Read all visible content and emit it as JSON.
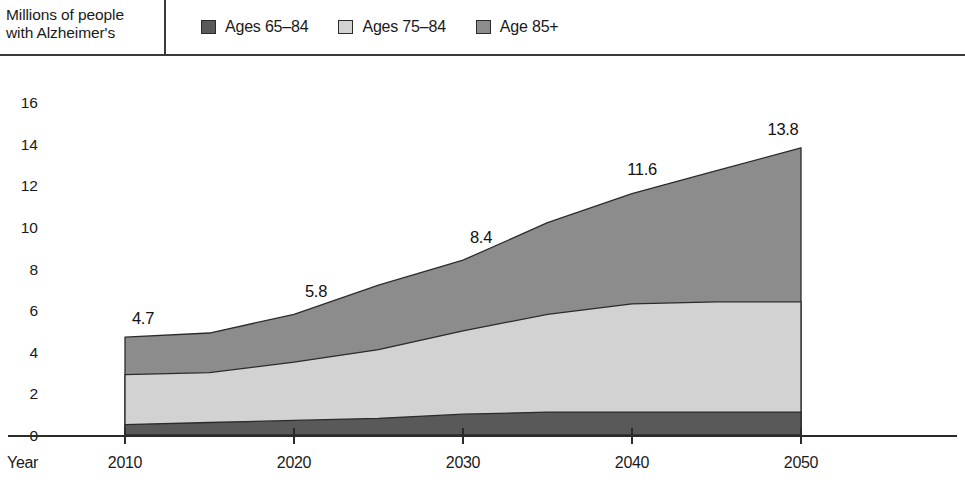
{
  "header": {
    "axis_title": "Millions of people\nwith Alzheimer's",
    "legend": [
      {
        "label": "Ages 65–84",
        "color": "#595959",
        "icon": "legend-swatch-icon"
      },
      {
        "label": "Ages 75–84",
        "color": "#d2d2d2",
        "icon": "legend-swatch-icon"
      },
      {
        "label": "Age 85+",
        "color": "#8c8c8c",
        "icon": "legend-swatch-icon"
      }
    ]
  },
  "chart_data": {
    "type": "area",
    "stacked": true,
    "title": "",
    "xlabel": "Year",
    "ylabel": "Millions of people with Alzheimer's",
    "x": [
      2010,
      2015,
      2020,
      2025,
      2030,
      2035,
      2040,
      2045,
      2050
    ],
    "xticks": [
      2010,
      2020,
      2030,
      2040,
      2050
    ],
    "xtick_labels": [
      "2010",
      "2020",
      "2030",
      "2040",
      "2050"
    ],
    "xlim": [
      2010,
      2050
    ],
    "yticks": [
      0,
      2,
      4,
      6,
      8,
      10,
      12,
      14,
      16
    ],
    "ytick_labels": [
      "0",
      "2",
      "4",
      "6",
      "8",
      "10",
      "12",
      "14",
      "16"
    ],
    "ylim": [
      0,
      16
    ],
    "grid": false,
    "legend_position": "top",
    "series": [
      {
        "name": "Ages 65–84",
        "color": "#595959",
        "values": [
          0.5,
          0.6,
          0.7,
          0.8,
          1.0,
          1.1,
          1.1,
          1.1,
          1.1
        ]
      },
      {
        "name": "Ages 75–84",
        "color": "#d2d2d2",
        "values": [
          2.4,
          2.4,
          2.8,
          3.3,
          4.0,
          4.7,
          5.2,
          5.3,
          5.3
        ]
      },
      {
        "name": "Age 85+",
        "color": "#8c8c8c",
        "values": [
          1.8,
          1.9,
          2.3,
          3.1,
          3.4,
          4.4,
          5.3,
          6.3,
          7.4
        ]
      }
    ],
    "totals": [
      4.7,
      4.9,
      5.8,
      7.2,
      8.4,
      10.2,
      11.6,
      12.7,
      13.8
    ],
    "point_labels": [
      {
        "x": 2010,
        "value": "4.7"
      },
      {
        "x": 2020,
        "value": "5.8"
      },
      {
        "x": 2030,
        "value": "8.4"
      },
      {
        "x": 2040,
        "value": "11.6"
      },
      {
        "x": 2050,
        "value": "13.8"
      }
    ]
  }
}
